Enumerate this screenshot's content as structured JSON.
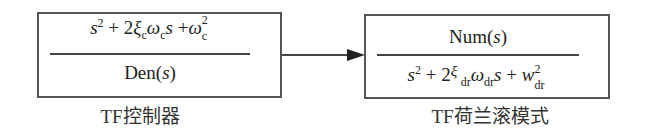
{
  "blocks": [
    {
      "id": "controller",
      "caption": "TF控制器",
      "numerator": {
        "parts": [
          "s",
          "2",
          " + 2",
          "ξ",
          "c",
          "ω",
          "c",
          "s",
          " +",
          "ω",
          "2",
          "c"
        ],
        "text": "s^2 + 2ξ_c ω_c s + ω_c^2"
      },
      "denominator": {
        "prefix": "Den(",
        "var": "s",
        "suffix": ")",
        "text": "Den(s)"
      }
    },
    {
      "id": "dutch-roll",
      "caption": "TF荷兰滚模式",
      "numerator": {
        "prefix": "Num(",
        "var": "s",
        "suffix": ")",
        "text": "Num(s)"
      },
      "denominator": {
        "parts": [
          "s",
          "2",
          " + 2",
          "ξ",
          "dr",
          "ω",
          "dr",
          "s",
          " + ",
          "w",
          "2",
          "dr"
        ],
        "text": "s^2 + 2ξ_dr ω_dr s + w_dr^2"
      }
    }
  ],
  "connection": {
    "from": "controller",
    "to": "dutch-roll",
    "type": "arrow"
  }
}
